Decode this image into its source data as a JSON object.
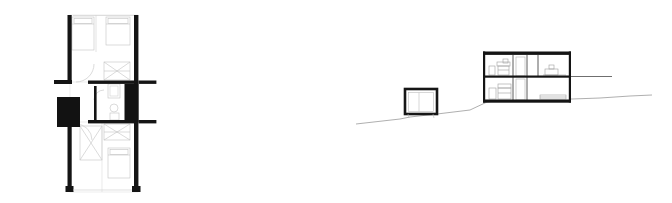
{
  "drawing": {
    "title": "Architectural drawing sheet",
    "background_color": "#ffffff",
    "ink_color": "#111111",
    "thin_line_color": "#b9b9b9",
    "medium_line_color": "#6e6e6e",
    "terrain_line_color": "#8c8c8c",
    "sheet_width": 672,
    "sheet_height": 203
  },
  "figures": [
    {
      "id": "floor-plan",
      "label": "Floor plan",
      "position": "left",
      "bounds": {
        "x": 48,
        "y": 12,
        "width": 110,
        "height": 185
      },
      "elements": [
        {
          "name": "exterior-wall-left",
          "type": "poche-wall",
          "orientation": "vertical"
        },
        {
          "name": "exterior-wall-right",
          "type": "poche-wall",
          "orientation": "vertical"
        },
        {
          "name": "partition-wall-upper",
          "type": "poche-wall",
          "orientation": "horizontal"
        },
        {
          "name": "partition-wall-lower",
          "type": "poche-wall",
          "orientation": "horizontal"
        },
        {
          "name": "wall-stub-left",
          "type": "poche-wall",
          "orientation": "horizontal"
        },
        {
          "name": "stove-block",
          "type": "solid-mass"
        },
        {
          "name": "service-core-block",
          "type": "solid-mass"
        },
        {
          "name": "stair-run",
          "type": "thin-line-detail"
        },
        {
          "name": "bed-furniture-upper-left",
          "type": "thin-line-detail"
        },
        {
          "name": "bed-furniture-upper-right",
          "type": "thin-line-detail"
        },
        {
          "name": "bed-furniture-lower-right",
          "type": "thin-line-detail"
        },
        {
          "name": "bathroom-fixtures",
          "type": "thin-line-detail"
        },
        {
          "name": "door-swing-upper",
          "type": "arc"
        },
        {
          "name": "door-swing-lower",
          "type": "arc"
        }
      ]
    },
    {
      "id": "site-section",
      "label": "Site section",
      "position": "right",
      "bounds": {
        "x": 352,
        "y": 40,
        "width": 300,
        "height": 95
      },
      "elements": [
        {
          "name": "terrain-line",
          "type": "ground-profile"
        },
        {
          "name": "outbuilding",
          "type": "small-volume"
        },
        {
          "name": "main-building",
          "type": "two-storey-volume"
        },
        {
          "name": "roof-slab",
          "type": "poche-slab"
        },
        {
          "name": "intermediate-floor-slab",
          "type": "poche-slab"
        },
        {
          "name": "ground-floor-slab",
          "type": "poche-slab"
        },
        {
          "name": "interior-partition",
          "type": "thin-line-detail"
        },
        {
          "name": "upper-level-furniture",
          "type": "thin-line-detail"
        },
        {
          "name": "lower-level-furniture",
          "type": "thin-line-detail"
        },
        {
          "name": "retaining-ground-line",
          "type": "ground-profile"
        }
      ]
    }
  ]
}
